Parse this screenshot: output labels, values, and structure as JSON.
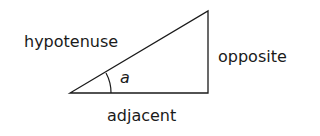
{
  "diagram": {
    "type": "right-triangle",
    "labels": {
      "hypotenuse": "hypotenuse",
      "opposite": "opposite",
      "adjacent": "adjacent",
      "angle": "a"
    },
    "colors": {
      "stroke": "#1a1a1a",
      "background": "#ffffff"
    }
  }
}
